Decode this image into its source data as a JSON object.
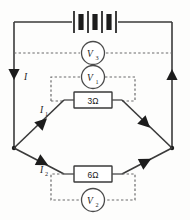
{
  "diagram": {
    "type": "electrical-circuit-schematic",
    "background_color": "#fdfdfc",
    "wire_color": "#3a3a3a",
    "dashed_color": "#6b6b6b",
    "ink_color": "#1c1c1c"
  },
  "source": {
    "name": "battery",
    "symbol": "battery-multicell",
    "cell_count": 3,
    "label": ""
  },
  "meters": [
    {
      "id": "v3",
      "name": "voltmeter-v3",
      "letter": "V",
      "subscript": "3",
      "position": "top-dashed-rail",
      "measures": "supply terminal voltage across full circuit"
    },
    {
      "id": "v1",
      "name": "voltmeter-v1",
      "letter": "V",
      "subscript": "1",
      "position": "upper-branch",
      "measures": "voltage across 3 ohm resistor"
    },
    {
      "id": "v2",
      "name": "voltmeter-v2",
      "letter": "V",
      "subscript": "2",
      "position": "lower-branch",
      "measures": "voltage across 6 ohm resistor"
    }
  ],
  "resistors": [
    {
      "id": "r1",
      "name": "resistor-3-ohm",
      "label": "3Ω",
      "value": 3,
      "unit": "Ω",
      "branch": "upper"
    },
    {
      "id": "r2",
      "name": "resistor-6-ohm",
      "label": "6Ω",
      "value": 6,
      "unit": "Ω",
      "branch": "lower"
    }
  ],
  "currents": [
    {
      "id": "i",
      "name": "current-i",
      "letter": "I",
      "subscript": "",
      "location": "left main rail",
      "direction": "down"
    },
    {
      "id": "i1",
      "name": "current-i1",
      "letter": "I",
      "subscript": "1",
      "location": "upper branch",
      "direction": "toward right node"
    },
    {
      "id": "i2",
      "name": "current-i2",
      "letter": "I",
      "subscript": "2",
      "location": "lower branch",
      "direction": "toward right node"
    }
  ],
  "arrows": [
    {
      "name": "arrow-left-rail",
      "direction": "down"
    },
    {
      "name": "arrow-right-rail",
      "direction": "up"
    },
    {
      "name": "arrow-upper-left-branch",
      "direction": "right-up"
    },
    {
      "name": "arrow-lower-left-branch",
      "direction": "right-down"
    },
    {
      "name": "arrow-upper-right-branch",
      "direction": "right-up"
    },
    {
      "name": "arrow-lower-right-branch",
      "direction": "right-down"
    }
  ]
}
